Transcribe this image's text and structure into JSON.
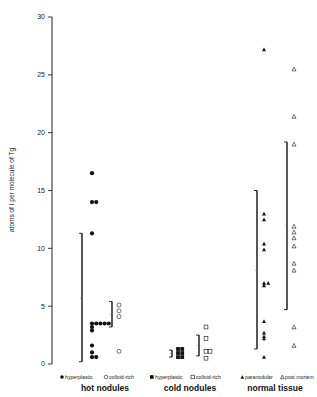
{
  "chart_data": {
    "type": "scatter",
    "title": "",
    "xlabel": "",
    "ylabel": "atoms of I per molecule of Tg",
    "ylim": [
      0,
      30
    ],
    "yticks": [
      0,
      5,
      10,
      15,
      20,
      25,
      30
    ],
    "grid": false,
    "groups": [
      {
        "name": "hot nodules",
        "series": [
          {
            "name": "hyperplastic",
            "marker": "filled-circle",
            "values": [
              16.5,
              14.0,
              14.0,
              11.3,
              3.5,
              3.5,
              3.5,
              3.5,
              3.5,
              3.2,
              2.9,
              1.6,
              1.0,
              0.6,
              0.6
            ],
            "range": {
              "top": 11.3,
              "mid": 5.7,
              "bottom": 0.2
            }
          },
          {
            "name": "colloid-rich",
            "marker": "open-circle",
            "values": [
              5.1,
              4.6,
              4.1,
              1.1
            ],
            "range": {
              "top": 5.4,
              "mid": 4.3,
              "bottom": 3.2
            }
          }
        ]
      },
      {
        "name": "cold nodules",
        "series": [
          {
            "name": "hyperplastic",
            "marker": "filled-square",
            "values": [
              1.3,
              1.3,
              0.95,
              0.95,
              0.6,
              0.6
            ],
            "range": {
              "top": 1.2,
              "mid": 0.9,
              "bottom": 0.6
            }
          },
          {
            "name": "colloid-rich",
            "marker": "open-square",
            "values": [
              3.2,
              2.2,
              1.1,
              1.1,
              0.5
            ],
            "range": {
              "top": 2.5,
              "mid": 1.6,
              "bottom": 0.7
            }
          }
        ]
      },
      {
        "name": "normal tissue",
        "series": [
          {
            "name": "paranodular",
            "marker": "filled-triangle",
            "values": [
              27.2,
              13.0,
              12.5,
              10.4,
              9.9,
              7.0,
              7.0,
              6.8,
              3.7,
              2.7,
              2.4,
              2.2,
              0.6
            ],
            "range": {
              "top": 15.0,
              "mid": 8.1,
              "bottom": 1.3
            }
          },
          {
            "name": "post mortem",
            "marker": "open-triangle",
            "values": [
              25.5,
              21.4,
              19.0,
              11.9,
              11.4,
              10.9,
              10.2,
              8.7,
              8.1,
              3.2,
              1.6
            ],
            "range": {
              "top": 19.2,
              "mid": 12.0,
              "bottom": 4.7
            }
          }
        ]
      }
    ]
  },
  "labels": {
    "ylabel": "atoms of I per molecule of Tg",
    "hot": "hot nodules",
    "cold": "cold nodules",
    "normal": "normal tissue",
    "legend_hot_hyper": "hyperplastic",
    "legend_hot_colloid": "colloid-rich",
    "legend_cold_hyper": "hyperplastic",
    "legend_cold_colloid": "colloid-rich",
    "legend_para": "paranodular",
    "legend_pm": "post mortem"
  }
}
